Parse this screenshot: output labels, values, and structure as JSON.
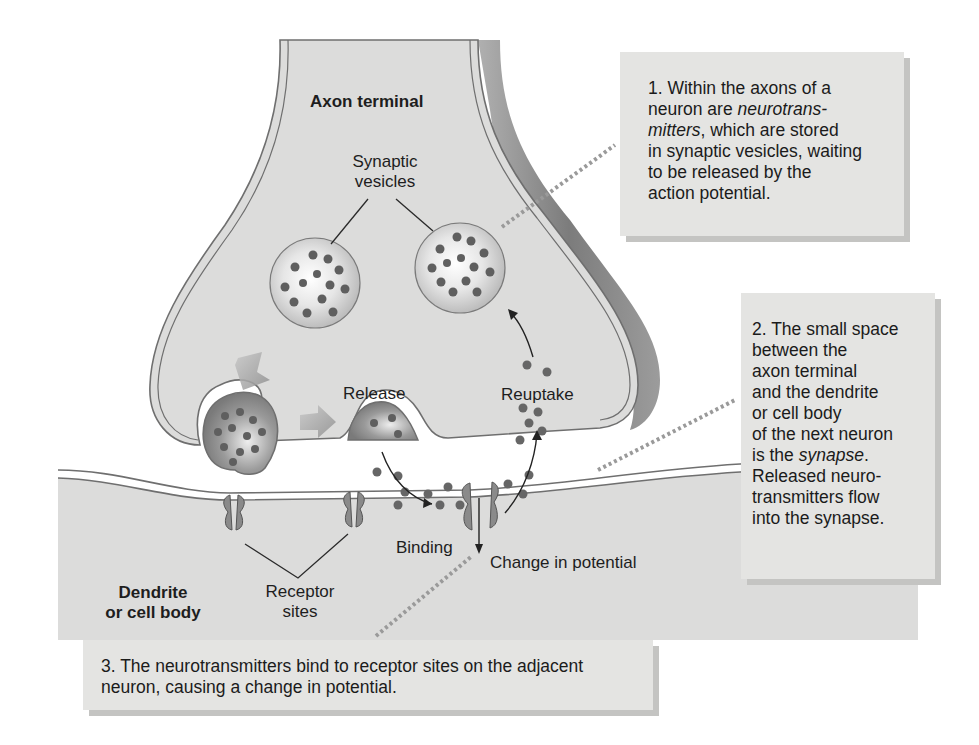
{
  "diagram": {
    "colors": {
      "cytoplasm": "#dcdcdb",
      "membrane_outline": "#6f6f6f",
      "membrane_fill": "#f4f4f4",
      "axon_shadow": "#8c8c8c",
      "receptor": "#8a8a8a",
      "neurotransmitter": "#666666",
      "callout_bg": "#e4e4e2",
      "callout_shadow": "#c4c4c2",
      "leader_dots": "#9a9a9a"
    },
    "labels": {
      "axon_terminal": "Axon terminal",
      "synaptic_vesicles_line1": "Synaptic",
      "synaptic_vesicles_line2": "vesicles",
      "release": "Release",
      "reuptake": "Reuptake",
      "binding": "Binding",
      "change_in_potential": "Change in potential",
      "receptor_sites_line1": "Receptor",
      "receptor_sites_line2": "sites",
      "dendrite_line1": "Dendrite",
      "dendrite_line2": "or cell body"
    },
    "callouts": [
      {
        "number": "1.",
        "text_before": "Within the axons of a neuron are ",
        "emphasis": "neurotrans- mitters",
        "text_after": ", which are stored in synaptic vesicles, waiting to be released by the action potential."
      },
      {
        "number": "2.",
        "text_before": "The small space between the axon terminal and the dendrite or cell body of the next neuron is the ",
        "emphasis": "synapse",
        "text_after": ". Released neuro- transmitters flow into the synapse."
      },
      {
        "number": "3.",
        "text": "The neurotransmitters bind to receptor sites on the adjacent neuron, causing a change in potential."
      }
    ]
  },
  "callout1": {
    "l1a": "1. Within the axons of a",
    "l2a": "neuron are ",
    "l2b": "neurotrans-",
    "l3a": "mitters",
    "l3b": ", which are stored",
    "l4": "in synaptic vesicles, waiting",
    "l5": "to be released by the",
    "l6": "action potential."
  },
  "callout2": {
    "l1": "2. The small space",
    "l2": "between the",
    "l3": "axon terminal",
    "l4": "and the dendrite",
    "l5": "or cell body",
    "l6": "of the next neuron",
    "l7a": "is the ",
    "l7b": "synapse",
    "l7c": ".",
    "l8": "Released neuro-",
    "l9": "transmitters flow",
    "l10": "into the synapse."
  },
  "callout3": {
    "l1": "3. The neurotransmitters bind to receptor sites on the adjacent",
    "l2": "neuron, causing a change in potential."
  }
}
